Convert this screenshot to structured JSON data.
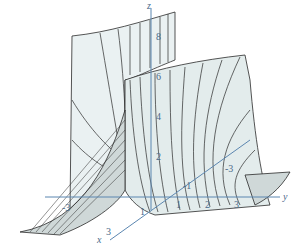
{
  "figure": {
    "type": "3d-surface-plot",
    "colors": {
      "surface_fill": "#e3ecec",
      "surface_fill_back": "#eaf1f2",
      "mesh_lines": "#2a2a2a",
      "axes": "#5b86b0",
      "labels": "#4a6a8a"
    },
    "axes": {
      "x": {
        "label": "x",
        "ticks": [
          "1",
          "3"
        ]
      },
      "y": {
        "label": "y",
        "ticks": [
          "1",
          "2",
          "3"
        ]
      },
      "z": {
        "label": "z",
        "ticks": [
          "8",
          "6",
          "4",
          "2"
        ]
      },
      "neg_ticks": [
        "-1",
        "-3",
        "-3"
      ]
    }
  }
}
